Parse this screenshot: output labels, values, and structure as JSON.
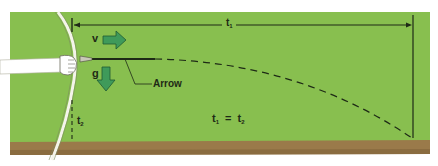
{
  "diagram": {
    "colors": {
      "grass": "#88bf4f",
      "ground": "#9a7a4a",
      "ground_dark": "#8a6c40",
      "background": "#ffffff",
      "line": "#1e2a16",
      "vector_fill": "#3f9a5a",
      "vector_stroke": "#1f5a33",
      "bow": "#f4f4ea",
      "hand": "#ffffff"
    },
    "labels": {
      "velocity": "v",
      "gravity": "g",
      "arrow": "Arrow",
      "t1_top": "t",
      "t1_top_sub": "1",
      "t2_left": "t",
      "t2_left_sub": "2",
      "eq_lhs": "t",
      "eq_lhs_sub": "1",
      "eq_sign": "=",
      "eq_rhs": "t",
      "eq_rhs_sub": "2"
    },
    "elements": [
      "bow",
      "hand",
      "arrow",
      "velocity-vector",
      "gravity-vector",
      "horizontal-time-line-t1",
      "vertical-drop-line-t2",
      "dashed-trajectory",
      "ground"
    ]
  }
}
